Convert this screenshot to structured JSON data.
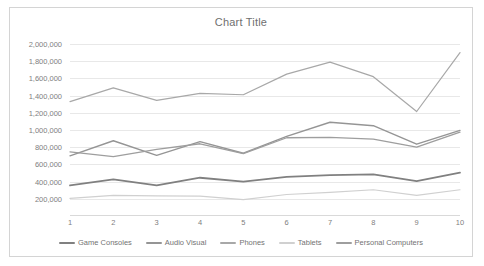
{
  "chart_data": {
    "type": "line",
    "title": "Chart Title",
    "xlabel": "",
    "ylabel": "",
    "x": [
      1,
      2,
      3,
      4,
      5,
      6,
      7,
      8,
      9,
      10
    ],
    "categories": [
      "1",
      "2",
      "3",
      "4",
      "5",
      "6",
      "7",
      "8",
      "9",
      "10"
    ],
    "ylim": [
      0,
      2000000
    ],
    "ytick_values": [
      200000,
      400000,
      600000,
      800000,
      1000000,
      1200000,
      1400000,
      1600000,
      1800000,
      2000000
    ],
    "ytick_labels": [
      "200,000",
      "400,000",
      "600,000",
      "800,000",
      "1,000,000",
      "1,200,000",
      "1,400,000",
      "1,600,000",
      "1,800,000",
      "2,000,000"
    ],
    "grid": true,
    "legend_position": "bottom",
    "series": [
      {
        "name": "Game Consoles",
        "color": "#808080",
        "width": 1.8,
        "values": [
          355000,
          425000,
          355000,
          445000,
          400000,
          455000,
          475000,
          485000,
          405000,
          505000
        ]
      },
      {
        "name": "Audio Visual",
        "color": "#959595",
        "width": 1.4,
        "values": [
          700000,
          875000,
          705000,
          865000,
          730000,
          925000,
          1090000,
          1050000,
          835000,
          995000
        ]
      },
      {
        "name": "Phones",
        "color": "#a8a8a8",
        "width": 1.2,
        "values": [
          1330000,
          1490000,
          1345000,
          1425000,
          1410000,
          1650000,
          1790000,
          1620000,
          1215000,
          1900000
        ]
      },
      {
        "name": "Tablets",
        "color": "#d0d0d0",
        "width": 1.2,
        "values": [
          205000,
          240000,
          235000,
          230000,
          190000,
          250000,
          275000,
          305000,
          240000,
          305000
        ]
      },
      {
        "name": "Personal Computers",
        "color": "#9e9e9e",
        "width": 1.3,
        "values": [
          745000,
          690000,
          775000,
          840000,
          725000,
          910000,
          915000,
          895000,
          800000,
          975000
        ]
      }
    ]
  }
}
